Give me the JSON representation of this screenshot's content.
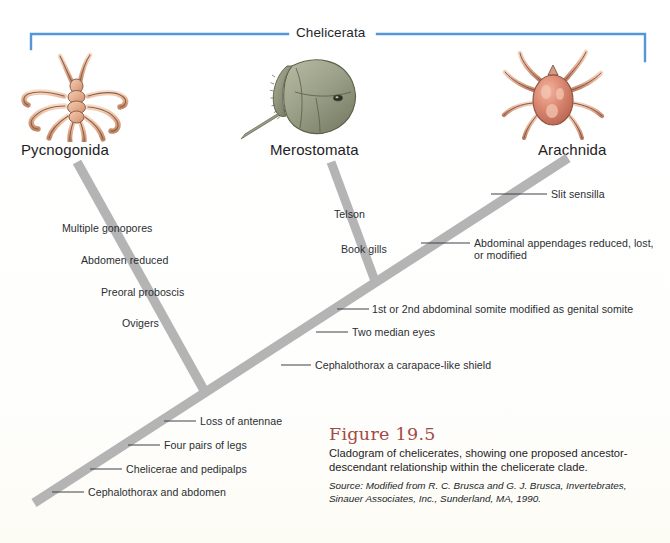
{
  "figure": {
    "clade_bracket_label": "Chelicerata",
    "bracket_color": "#5596d8",
    "branch_color": "#b4b4b4",
    "leader_color": "#3d4246"
  },
  "taxa": [
    {
      "name": "Pycnogonida",
      "illustration": "sea-spider-illustration"
    },
    {
      "name": "Merostomata",
      "illustration": "horseshoe-crab-illustration"
    },
    {
      "name": "Arachnida",
      "illustration": "tick-illustration"
    }
  ],
  "characters": {
    "pycnogonida_branch": [
      {
        "label": "Multiple gonopores"
      },
      {
        "label": "Abdomen reduced"
      },
      {
        "label": "Preoral proboscis"
      },
      {
        "label": "Ovigers"
      }
    ],
    "merostomata_branch": [
      {
        "label": "Telson"
      },
      {
        "label": "Book gills"
      }
    ],
    "arachnida_branch": [
      {
        "label": "Slit sensilla"
      },
      {
        "label": "Abdominal appendages reduced, lost, or modified"
      }
    ],
    "trunk": [
      {
        "label": "1st or 2nd abdominal somite modified as genital somite"
      },
      {
        "label": "Two median eyes"
      },
      {
        "label": "Cephalothorax a carapace-like shield"
      },
      {
        "label": "Loss of antennae"
      },
      {
        "label": "Four pairs of legs"
      },
      {
        "label": "Chelicerae and pedipalps"
      },
      {
        "label": "Cephalothorax and abdomen"
      }
    ]
  },
  "caption": {
    "title": "Figure 19.5",
    "body": "Cladogram of chelicerates, showing one proposed ancestor-descendant relationship within the chelicerate clade.",
    "source": "Source: Modified from R. C. Brusca and G. J. Brusca, Invertebrates, Sinauer Associates, Inc., Sunderland, MA, 1990."
  }
}
